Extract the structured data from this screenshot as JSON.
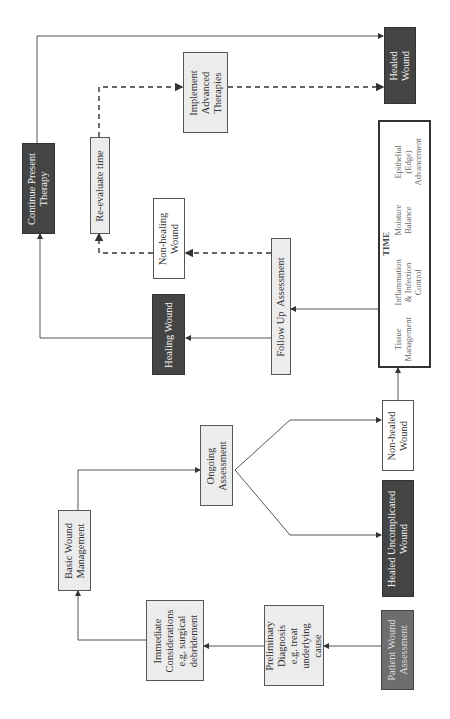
{
  "diagram": {
    "type": "flowchart",
    "orientation": "rotated-90-ccw",
    "nodes": {
      "patient_wound_assessment": "Patient Wound\nAssessment",
      "preliminary_diagnosis": "Preliminary\nDiagnosis\ne.g. treat\nunderlying\ncause",
      "immediate_considerations": "Immediate\nConsiderations\ne.g. surgical\ndebridement",
      "basic_wound_management": "Basic Wound\nManagement",
      "ongoing_assessment": "Ongoing\nAssessment",
      "healed_uncomplicated_wound": "Healed Uncomplicated\nWound",
      "non_healed_wound": "Non-healed\nWound",
      "follow_up_assessment": "Follow Up  Assessment",
      "healing_wound": "Healing Wound",
      "non_healing_wound": "Non-healing\nWound",
      "re_evaluate_time": "Re-evaluate time",
      "continue_present_therapy": "Continue Present\nTherapy",
      "implement_advanced_therapies": "Implement\nAdvanced\nTherapies",
      "healed_wound": "Healed\nWound"
    },
    "time_box": {
      "title": "TIME",
      "items": [
        "Tissue\nManagement",
        "Inflammation\n& Infection\nControl",
        "Moisture\nBalance",
        "Epithelial\n(Edge)\nAdvancement"
      ]
    },
    "edges": [
      {
        "from": "Patient Wound Assessment",
        "to": "Preliminary Diagnosis",
        "style": "solid"
      },
      {
        "from": "Preliminary Diagnosis",
        "to": "Immediate Considerations",
        "style": "solid"
      },
      {
        "from": "Immediate Considerations",
        "to": "Basic Wound Management",
        "style": "solid"
      },
      {
        "from": "Basic Wound Management",
        "to": "Ongoing Assessment",
        "style": "solid"
      },
      {
        "from": "Ongoing Assessment",
        "to": "Healed Uncomplicated Wound",
        "style": "solid"
      },
      {
        "from": "Ongoing Assessment",
        "to": "Non-healed Wound",
        "style": "solid"
      },
      {
        "from": "Non-healed Wound",
        "to": "TIME",
        "style": "solid"
      },
      {
        "from": "TIME",
        "to": "Follow Up Assessment",
        "style": "solid"
      },
      {
        "from": "Follow Up Assessment",
        "to": "Healing Wound",
        "style": "solid"
      },
      {
        "from": "Follow Up Assessment",
        "to": "Non-healing Wound",
        "style": "dashed"
      },
      {
        "from": "Healing Wound",
        "to": "Continue Present Therapy",
        "style": "solid"
      },
      {
        "from": "Continue Present Therapy",
        "to": "Healed Wound",
        "style": "solid"
      },
      {
        "from": "Non-healing Wound",
        "to": "Re-evaluate time",
        "style": "dashed"
      },
      {
        "from": "Re-evaluate time",
        "to": "Implement Advanced Therapies",
        "style": "dashed"
      },
      {
        "from": "Implement Advanced Therapies",
        "to": "Healed Wound",
        "style": "dashed"
      }
    ],
    "colors": {
      "dark_node": "#444444",
      "patient_node": "#6e6e6e",
      "light_node": "#ececec",
      "line": "#555555"
    }
  }
}
